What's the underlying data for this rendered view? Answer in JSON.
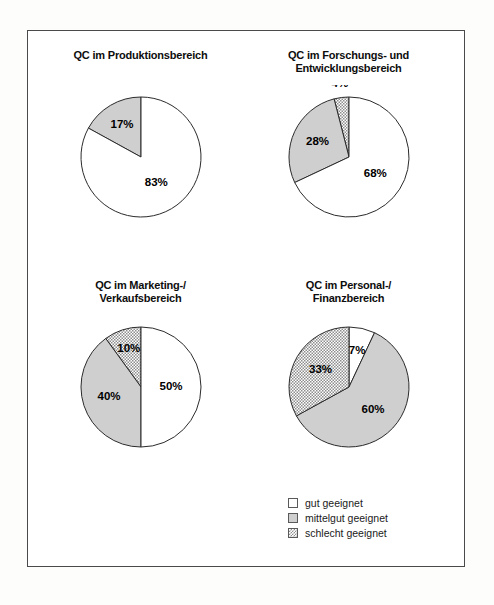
{
  "legend": {
    "items": [
      {
        "label": "gut geeignet",
        "key": "gut",
        "swatch": "white",
        "color": "#ffffff"
      },
      {
        "label": "mittelgut geeignet",
        "key": "mittelgut",
        "swatch": "gray",
        "color": "#cfcfcf"
      },
      {
        "label": "schlecht geeignet",
        "key": "schlecht",
        "swatch": "hatch",
        "color": "#8e8e8e"
      }
    ]
  },
  "chart_data": [
    {
      "type": "pie",
      "id": "produktionsbereich",
      "title": "QC im Produktionsbereich",
      "title_lines": [
        "QC im Produktionsbereich"
      ],
      "categories": [
        "gut geeignet",
        "mittelgut geeignet",
        "schlecht geeignet"
      ],
      "values": [
        83,
        17,
        0
      ],
      "labels": [
        "83%",
        "17%",
        ""
      ],
      "slices": [
        {
          "label": "17%",
          "value": 17,
          "category": "mittelgut geeignet",
          "fill": "gray",
          "start_deg": 298.8,
          "end_deg": 360.0,
          "label_r": 0.62
        },
        {
          "label": "83%",
          "value": 83,
          "category": "gut geeignet",
          "fill": "white",
          "start_deg": 0.0,
          "end_deg": 298.8,
          "label_r": 0.5
        }
      ]
    },
    {
      "type": "pie",
      "id": "forschung-entwicklung",
      "title": "QC im Forschungs- und Entwicklungsbereich",
      "title_lines": [
        "QC im Forschungs- und",
        "Entwicklungsbereich"
      ],
      "categories": [
        "gut geeignet",
        "mittelgut geeignet",
        "schlecht geeignet"
      ],
      "values": [
        68,
        28,
        4
      ],
      "labels": [
        "68%",
        "28%",
        "4%"
      ],
      "slices": [
        {
          "label": "4%",
          "value": 4,
          "category": "schlecht geeignet",
          "fill": "hatch",
          "start_deg": 345.6,
          "end_deg": 360.0,
          "label_r": 1.22
        },
        {
          "label": "28%",
          "value": 28,
          "category": "mittelgut geeignet",
          "fill": "gray",
          "start_deg": 244.8,
          "end_deg": 345.6,
          "label_r": 0.58
        },
        {
          "label": "68%",
          "value": 68,
          "category": "gut geeignet",
          "fill": "white",
          "start_deg": 0.0,
          "end_deg": 244.8,
          "label_r": 0.52
        }
      ]
    },
    {
      "type": "pie",
      "id": "marketing-verkauf",
      "title": "QC im Marketing-/ Verkaufsbereich",
      "title_lines": [
        "QC im Marketing-/",
        "Verkaufsbereich"
      ],
      "categories": [
        "gut geeignet",
        "mittelgut geeignet",
        "schlecht geeignet"
      ],
      "values": [
        50,
        40,
        10
      ],
      "labels": [
        "50%",
        "40%",
        "10%"
      ],
      "slices": [
        {
          "label": "10%",
          "value": 10,
          "category": "schlecht geeignet",
          "fill": "hatch",
          "start_deg": 324.0,
          "end_deg": 360.0,
          "label_r": 0.66
        },
        {
          "label": "40%",
          "value": 40,
          "category": "mittelgut geeignet",
          "fill": "gray",
          "start_deg": 180.0,
          "end_deg": 324.0,
          "label_r": 0.56
        },
        {
          "label": "50%",
          "value": 50,
          "category": "gut geeignet",
          "fill": "white",
          "start_deg": 0.0,
          "end_deg": 180.0,
          "label_r": 0.5
        }
      ]
    },
    {
      "type": "pie",
      "id": "personal-finanz",
      "title": "QC im Personal-/ Finanzbereich",
      "title_lines": [
        "QC im Personal-/",
        "Finanzbereich"
      ],
      "categories": [
        "gut geeignet",
        "mittelgut geeignet",
        "schlecht geeignet"
      ],
      "values": [
        7,
        60,
        33
      ],
      "labels": [
        "7%",
        "60%",
        "33%"
      ],
      "slices": [
        {
          "label": "7%",
          "value": 7,
          "category": "gut geeignet",
          "fill": "white",
          "start_deg": 0.0,
          "end_deg": 25.2,
          "label_r": 0.62
        },
        {
          "label": "60%",
          "value": 60,
          "category": "mittelgut geeignet",
          "fill": "gray",
          "start_deg": 25.2,
          "end_deg": 241.2,
          "label_r": 0.55
        },
        {
          "label": "33%",
          "value": 33,
          "category": "schlecht geeignet",
          "fill": "hatch",
          "start_deg": 241.2,
          "end_deg": 360.0,
          "label_r": 0.55
        }
      ]
    }
  ]
}
